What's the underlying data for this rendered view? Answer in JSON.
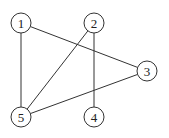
{
  "diagram": {
    "type": "undirected-graph",
    "nodes": [
      {
        "id": "1",
        "label": "1",
        "x": 21,
        "y": 23
      },
      {
        "id": "2",
        "label": "2",
        "x": 94,
        "y": 23
      },
      {
        "id": "3",
        "label": "3",
        "x": 147,
        "y": 71
      },
      {
        "id": "4",
        "label": "4",
        "x": 94,
        "y": 117
      },
      {
        "id": "5",
        "label": "5",
        "x": 21,
        "y": 117
      }
    ],
    "edges": [
      [
        "1",
        "3"
      ],
      [
        "1",
        "5"
      ],
      [
        "2",
        "5"
      ],
      [
        "2",
        "4"
      ],
      [
        "3",
        "5"
      ]
    ],
    "node_radius": 10,
    "colors": {
      "stroke": "#333333",
      "fill": "#ffffff",
      "text": "#222222"
    }
  }
}
